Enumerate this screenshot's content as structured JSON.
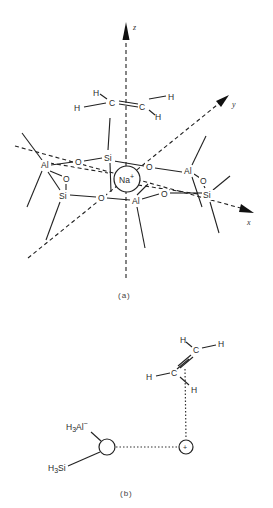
{
  "figure": {
    "part_a": {
      "caption": "(a)",
      "axes": {
        "z": "z",
        "y": "y",
        "x": "x"
      },
      "ethylene": {
        "carbons": [
          "C",
          "C"
        ],
        "hydrogens": [
          "H",
          "H",
          "H",
          "H"
        ]
      },
      "framework_atoms": {
        "si_top": "Si",
        "o_top_left": "O",
        "o_top_right": "O",
        "al_left": "Al",
        "o_left": "O",
        "si_left": "Si",
        "o_bottom": "O",
        "al_bottom": "Al",
        "o_bottom_right": "O",
        "al_right": "Al",
        "o_right": "O",
        "si_right": "Si"
      },
      "cation": {
        "symbol": "Na",
        "charge": "+"
      }
    },
    "part_b": {
      "caption": "(b)",
      "ethylene": {
        "carbons": [
          "C",
          "C"
        ],
        "hydrogens": [
          "H",
          "H",
          "H",
          "H"
        ]
      },
      "cation_symbol": "+",
      "al_group": {
        "base": "H",
        "sub": "3",
        "rest": "Al",
        "sup": "−"
      },
      "si_group": {
        "base": "H",
        "sub": "3",
        "rest": "Si"
      }
    }
  }
}
